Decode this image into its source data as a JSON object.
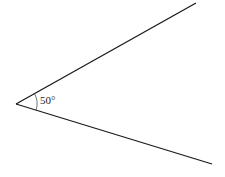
{
  "diagram": {
    "type": "angle",
    "angle_label": "50°",
    "angle_degrees": 50,
    "vertex": [
      16,
      104
    ],
    "ray_upper_end": [
      196,
      3
    ],
    "ray_lower_end": [
      212,
      164
    ],
    "line_color": "#1a1a1a"
  }
}
